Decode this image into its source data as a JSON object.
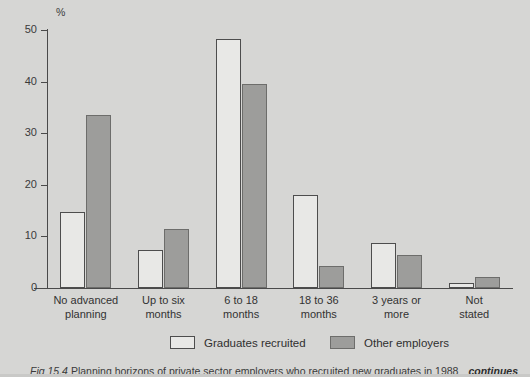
{
  "chart_data": {
    "type": "bar",
    "title": "",
    "xlabel": "",
    "ylabel": "%",
    "ylim": [
      0,
      50
    ],
    "yticks": [
      0,
      10,
      20,
      30,
      40,
      50
    ],
    "grid": false,
    "legend_position": "bottom",
    "categories": [
      "No advanced\nplanning",
      "Up to six\nmonths",
      "6 to 18\nmonths",
      "18 to 36\nmonths",
      "3 years or\nmore",
      "Not\nstated"
    ],
    "category_lines": [
      [
        "No advanced",
        "planning"
      ],
      [
        "Up to six",
        "months"
      ],
      [
        "6 to 18",
        "months"
      ],
      [
        "18 to 36",
        "months"
      ],
      [
        "3 years or",
        "more"
      ],
      [
        "Not",
        "stated"
      ]
    ],
    "series": [
      {
        "name": "Graduates recruited",
        "color": "#e8e8e6",
        "values": [
          14.7,
          7.3,
          48.3,
          18.0,
          8.7,
          1.0
        ]
      },
      {
        "name": "Other employers",
        "color": "#9d9d9b",
        "values": [
          33.5,
          11.5,
          39.6,
          4.2,
          6.4,
          2.1
        ]
      }
    ]
  },
  "axis": {
    "unit_label": "%",
    "tick_labels": [
      "50",
      "40",
      "30",
      "20",
      "10",
      "0"
    ]
  },
  "legend": {
    "items": [
      {
        "label": "Graduates recruited",
        "swatch": "white"
      },
      {
        "label": "Other employers",
        "swatch": "grey"
      }
    ]
  },
  "caption": {
    "figure_number": "Fig 15.4",
    "text": "Planning horizons of private sector employers who recruited new graduates in 1988",
    "continues_label": "continues"
  },
  "colors": {
    "background": "#d6d6d4",
    "axis": "#4a4a4a",
    "series_white": "#e8e8e6",
    "series_grey": "#9d9d9b",
    "text": "#2f2f2f"
  }
}
